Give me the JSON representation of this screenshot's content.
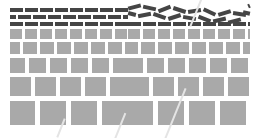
{
  "figure": {
    "title": "",
    "background_color": "#ffffff",
    "width": 254,
    "height": 138,
    "panels": [
      {
        "id": "panel-left",
        "name": "ordered-layered-block-wall",
        "description": "Layered block wall: thin dark bars at top grading into progressively larger light-gray square blocks toward the bottom, all aligned in regular ordered courses.",
        "x": 10,
        "width": 118,
        "block_color": "#a9a9a9",
        "bar_color": "#454545",
        "layers": [
          {
            "name": "dark-bar-course-1",
            "y": 8,
            "block_w": 13,
            "block_h": 4,
            "gap": 2,
            "color": "#454545",
            "offset": 0,
            "rotated": false
          },
          {
            "name": "dark-bar-course-2",
            "y": 15,
            "block_w": 13,
            "block_h": 4,
            "gap": 2,
            "color": "#454545",
            "offset": 7.5,
            "rotated": false
          },
          {
            "name": "dark-bar-course-3",
            "y": 22,
            "block_w": 13,
            "block_h": 4,
            "gap": 2,
            "color": "#454545",
            "offset": 0,
            "rotated": false
          },
          {
            "name": "gray-block-course-1",
            "y": 29,
            "block_w": 12,
            "block_h": 10,
            "gap": 3,
            "color": "#a9a9a9",
            "offset": 0,
            "rotated": false
          },
          {
            "name": "gray-block-course-2",
            "y": 42,
            "block_w": 14,
            "block_h": 12,
            "gap": 3,
            "color": "#a9a9a9",
            "offset": 4,
            "rotated": false
          },
          {
            "name": "gray-block-course-3",
            "y": 58,
            "block_w": 17,
            "block_h": 15,
            "gap": 4,
            "color": "#a9a9a9",
            "offset": 2,
            "rotated": false
          },
          {
            "name": "gray-block-course-4",
            "y": 77,
            "block_w": 21,
            "block_h": 19,
            "gap": 4,
            "color": "#a9a9a9",
            "offset": 0,
            "rotated": false
          },
          {
            "name": "gray-block-course-5",
            "y": 101,
            "block_w": 26,
            "block_h": 24,
            "gap": 5,
            "color": "#a9a9a9",
            "offset": 1,
            "rotated": false
          }
        ]
      },
      {
        "id": "panel-right",
        "name": "disordered-layered-block-wall",
        "description": "Same layered block wall but the uppermost thin dark bars are randomly tilted and jumbled, indicating a disordered surface layer; lower courses remain ordered light-gray blocks.",
        "x": 128,
        "width": 122,
        "block_color": "#a9a9a9",
        "bar_color": "#454545",
        "layers": [
          {
            "name": "tilted-bar-course-1",
            "y": 8,
            "block_w": 13,
            "block_h": 4,
            "gap": 2,
            "color": "#454545",
            "offset": 0,
            "rotated": true
          },
          {
            "name": "tilted-bar-course-2",
            "y": 15,
            "block_w": 13,
            "block_h": 4,
            "gap": 2,
            "color": "#454545",
            "offset": 5,
            "rotated": true
          },
          {
            "name": "dark-bar-course-3",
            "y": 22,
            "block_w": 13,
            "block_h": 4,
            "gap": 2,
            "color": "#454545",
            "offset": 0,
            "rotated": false
          },
          {
            "name": "gray-block-course-1",
            "y": 29,
            "block_w": 12,
            "block_h": 10,
            "gap": 3,
            "color": "#a9a9a9",
            "offset": 0,
            "rotated": false
          },
          {
            "name": "gray-block-course-2",
            "y": 42,
            "block_w": 14,
            "block_h": 12,
            "gap": 3,
            "color": "#a9a9a9",
            "offset": 4,
            "rotated": false
          },
          {
            "name": "gray-block-course-3",
            "y": 58,
            "block_w": 17,
            "block_h": 15,
            "gap": 4,
            "color": "#a9a9a9",
            "offset": 2,
            "rotated": false
          },
          {
            "name": "gray-block-course-4",
            "y": 77,
            "block_w": 21,
            "block_h": 19,
            "gap": 4,
            "color": "#a9a9a9",
            "offset": 0,
            "rotated": false
          },
          {
            "name": "gray-block-course-5",
            "y": 101,
            "block_w": 26,
            "block_h": 24,
            "gap": 5,
            "color": "#a9a9a9",
            "offset": 1,
            "rotated": false
          }
        ],
        "tilt_angles_deg": [
          -14,
          12,
          -22,
          18,
          -9,
          25,
          -17,
          8,
          -25,
          14,
          -11,
          20,
          -18,
          10,
          22,
          -13
        ]
      }
    ],
    "watermark": {
      "name": "diagonal-watermark-streak",
      "color": "#e4e4e4",
      "angle_deg": 22
    }
  }
}
